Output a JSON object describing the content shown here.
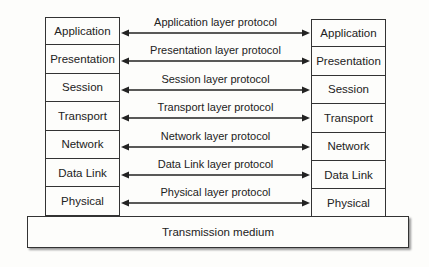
{
  "left_stack": [
    "Application",
    "Presentation",
    "Session",
    "Transport",
    "Network",
    "Data Link",
    "Physical"
  ],
  "right_stack": [
    "Application",
    "Presentation",
    "Session",
    "Transport",
    "Network",
    "Data Link",
    "Physical"
  ],
  "protocols": [
    "Application layer protocol",
    "Presentation layer protocol",
    "Session layer protocol",
    "Transport layer protocol",
    "Network layer protocol",
    "Data Link layer protocol",
    "Physical layer protocol"
  ],
  "medium": "Transmission medium"
}
